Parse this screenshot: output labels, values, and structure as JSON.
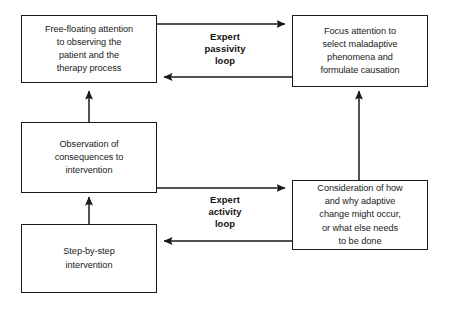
{
  "diagram": {
    "background_color": "#ffffff",
    "line_color": "#1a1a1a",
    "nodes": [
      {
        "id": "free-floating-attention",
        "text": "Free-floating attention\nto observing the\npatient and the\ntherapy process"
      },
      {
        "id": "focus-attention",
        "text": "Focus attention to\nselect maladaptive\nphenomena and\nformulate causation"
      },
      {
        "id": "observation-of-consequences",
        "text": "Observation of\nconsequences to\nintervention"
      },
      {
        "id": "consideration-of-change",
        "text": "Consideration of how\nand why adaptive\nchange might occur,\nor what else needs\nto be done"
      },
      {
        "id": "step-by-step-intervention",
        "text": "Step-by-step\nintervention"
      }
    ],
    "loop_labels": [
      {
        "id": "expert-passivity-loop",
        "text": "Expert\npassivity\nloop"
      },
      {
        "id": "expert-activity-loop",
        "text": "Expert\nactivity\nloop"
      }
    ]
  }
}
